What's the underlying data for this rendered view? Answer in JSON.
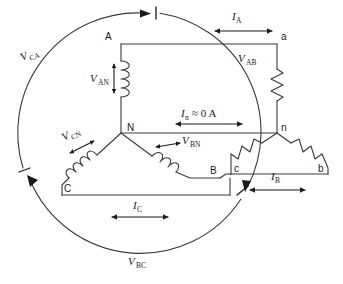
{
  "figure": {
    "type": "circuit-diagram",
    "width": 343,
    "height": 284,
    "line_color": "#3a3a3a",
    "text_color": "#1a1a1a",
    "background": "#ffffff"
  },
  "source": {
    "name": "Y-connected three-phase source",
    "neutral_node": "N",
    "terminals": [
      {
        "id": "A",
        "label": "A"
      },
      {
        "id": "B",
        "label": "B"
      },
      {
        "id": "C",
        "label": "C"
      }
    ],
    "phase_voltages": [
      {
        "id": "VAN",
        "symbol": "V",
        "subscript": "AN",
        "label": "V_AN"
      },
      {
        "id": "VBN",
        "symbol": "V",
        "subscript": "BN",
        "label": "V_BN"
      },
      {
        "id": "VCN",
        "symbol": "V",
        "subscript": "CN",
        "label": "V_CN"
      }
    ]
  },
  "load": {
    "name": "Y-connected three-phase load",
    "neutral_node": "n",
    "terminals": [
      {
        "id": "a",
        "label": "a"
      },
      {
        "id": "b",
        "label": "b"
      },
      {
        "id": "c",
        "label": "c"
      }
    ],
    "elements": [
      {
        "id": "Za",
        "type": "resistor",
        "between": [
          "a",
          "n"
        ]
      },
      {
        "id": "Zb",
        "type": "resistor",
        "between": [
          "b",
          "n"
        ]
      },
      {
        "id": "Zc",
        "type": "resistor",
        "between": [
          "c",
          "n"
        ]
      }
    ]
  },
  "node_labels": {
    "A": "A",
    "B": "B",
    "C": "C",
    "N": "N",
    "a": "a",
    "b": "b",
    "c": "c",
    "n": "n"
  },
  "line_voltages": [
    {
      "id": "VAB",
      "symbol": "V",
      "subscript": "AB",
      "label": "V_AB"
    },
    {
      "id": "VBC",
      "symbol": "V",
      "subscript": "BC",
      "label": "V_BC"
    },
    {
      "id": "VCA",
      "symbol": "V",
      "subscript": "CA",
      "label": "V_CA"
    }
  ],
  "currents": [
    {
      "id": "IA",
      "symbol": "I",
      "subscript": "A",
      "label": "I_A"
    },
    {
      "id": "IB",
      "symbol": "I",
      "subscript": "B",
      "label": "I_B"
    },
    {
      "id": "IC",
      "symbol": "I",
      "subscript": "C",
      "label": "I_C"
    },
    {
      "id": "In",
      "symbol": "I",
      "subscript": "n",
      "value": "≈ 0 A",
      "label": "I_n ≈ 0 A"
    }
  ],
  "labels": {
    "VCA_sym": "V",
    "VCA_sub": "CA",
    "VAB_sym": "V",
    "VAB_sub": "AB",
    "VBC_sym": "V",
    "VBC_sub": "BC",
    "VAN_sym": "V",
    "VAN_sub": "AN",
    "VBN_sym": "V",
    "VBN_sub": "BN",
    "VCN_sym": "V",
    "VCN_sub": "CN",
    "IA_sym": "I",
    "IA_sub": "A",
    "IB_sym": "I",
    "IB_sub": "B",
    "IC_sym": "I",
    "IC_sub": "C",
    "In_sym": "I",
    "In_sub": "n",
    "In_val": "≈ 0 A",
    "node_A": "A",
    "node_B": "B",
    "node_C": "C",
    "node_N": "N",
    "node_a": "a",
    "node_b": "b",
    "node_c": "c",
    "node_n": "n"
  }
}
